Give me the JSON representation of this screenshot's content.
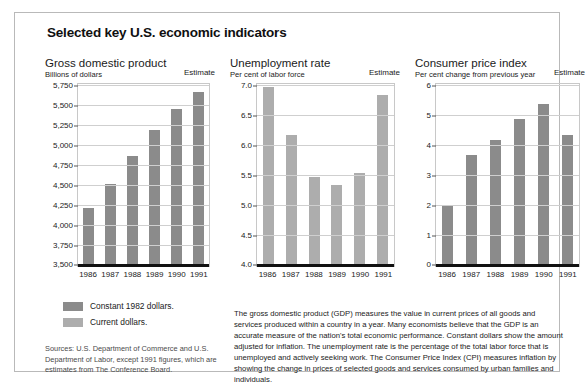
{
  "figure": {
    "title": "Selected key U.S. economic indicators"
  },
  "legend": {
    "items": [
      {
        "label": "Constant 1982 dollars.",
        "swatch": "dark",
        "color": "#8b8b8b"
      },
      {
        "label": "Current dollars.",
        "swatch": "light",
        "color": "#adadad"
      }
    ]
  },
  "sources": "Sources: U.S. Department of Commerce and U.S. Department of Labor, except 1991 figures, which are estimates from The Conference Board.",
  "note": "The gross domestic product (GDP) measures the value in current prices of all goods and services produced within a country in a year. Many economists believe that the GDP is an accurate measure of the nation's total economic performance. Constant dollars show the amount adjusted for inflation. The unemployment rate is the percentage of the total labor force that is unemployed and actively seeking work. The Consumer Price Index (CPI) measures inflation by showing the change in prices of selected goods and services consumed by urban families and individuals.",
  "estimate_label": "Estimate",
  "chart_data": [
    {
      "type": "bar",
      "title": "Gross domestic product",
      "subtitle": "Billions of dollars",
      "xlabel": "",
      "ylabel": "Billions of dollars",
      "categories": [
        "1986",
        "1987",
        "1988",
        "1989",
        "1990",
        "1991"
      ],
      "values": [
        4200,
        4500,
        4850,
        5170,
        5440,
        5650
      ],
      "ylim": [
        3500,
        5750
      ],
      "yticks": [
        "5,750",
        "5,500",
        "5,250",
        "5,000",
        "4,750",
        "4,500",
        "4,250",
        "4,000",
        "3,750",
        "3,500"
      ],
      "ytick_values": [
        5750,
        5500,
        5250,
        5000,
        4750,
        4500,
        4250,
        4000,
        3750,
        3500
      ],
      "bar_color": "#8b8b8b",
      "grid": true,
      "legend_position": "below-left"
    },
    {
      "type": "bar",
      "title": "Unemployment rate",
      "subtitle": "Per cent of labor force",
      "xlabel": "",
      "ylabel": "Per cent of labor force",
      "categories": [
        "1986",
        "1987",
        "1988",
        "1989",
        "1990",
        "1991"
      ],
      "values": [
        6.95,
        6.15,
        5.45,
        5.32,
        5.52,
        6.82
      ],
      "ylim": [
        4.0,
        7.0
      ],
      "yticks": [
        "7.0",
        "6.5",
        "6.0",
        "5.5",
        "5.0",
        "4.5",
        "4.0"
      ],
      "ytick_values": [
        7.0,
        6.5,
        6.0,
        5.5,
        5.0,
        4.5,
        4.0
      ],
      "bar_color": "#adadad",
      "grid": true,
      "legend_position": "none"
    },
    {
      "type": "bar",
      "title": "Consumer price index",
      "subtitle": "Per cent change from previous year",
      "xlabel": "",
      "ylabel": "Per cent change from previous year",
      "categories": [
        "1986",
        "1987",
        "1988",
        "1989",
        "1990",
        "1991"
      ],
      "values": [
        1.95,
        3.65,
        4.12,
        4.82,
        5.35,
        4.3
      ],
      "ylim": [
        0,
        6
      ],
      "yticks": [
        "6",
        "5",
        "4",
        "3",
        "2",
        "1",
        "0"
      ],
      "ytick_values": [
        6,
        5,
        4,
        3,
        2,
        1,
        0
      ],
      "bar_color": "#8b8b8b",
      "grid": true,
      "legend_position": "none"
    }
  ]
}
